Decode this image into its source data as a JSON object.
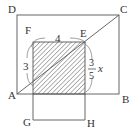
{
  "diagram": {
    "type": "geometry-figure",
    "points": {
      "A": "A",
      "B": "B",
      "C": "C",
      "D": "D",
      "E": "E",
      "F": "F",
      "G": "G",
      "H": "H"
    },
    "dimensions": {
      "top_width": "4",
      "left_height": "3",
      "right_fraction_numerator": "3",
      "right_fraction_denominator": "5",
      "right_variable": "x"
    },
    "shapes": [
      {
        "name": "rectangle-ABCD",
        "vertices": [
          "A",
          "B",
          "C",
          "D"
        ]
      },
      {
        "name": "diagonal-AC",
        "from": "A",
        "to": "C"
      },
      {
        "name": "shaded-square",
        "description": "hatched square with top-right vertex E on diagonal AC"
      },
      {
        "name": "rectangle-below",
        "bottom_vertices": [
          "G",
          "H"
        ]
      }
    ],
    "colors": {
      "line": "#555555",
      "hatch": "#555555",
      "text": "#333333",
      "background": "#ffffff"
    }
  }
}
